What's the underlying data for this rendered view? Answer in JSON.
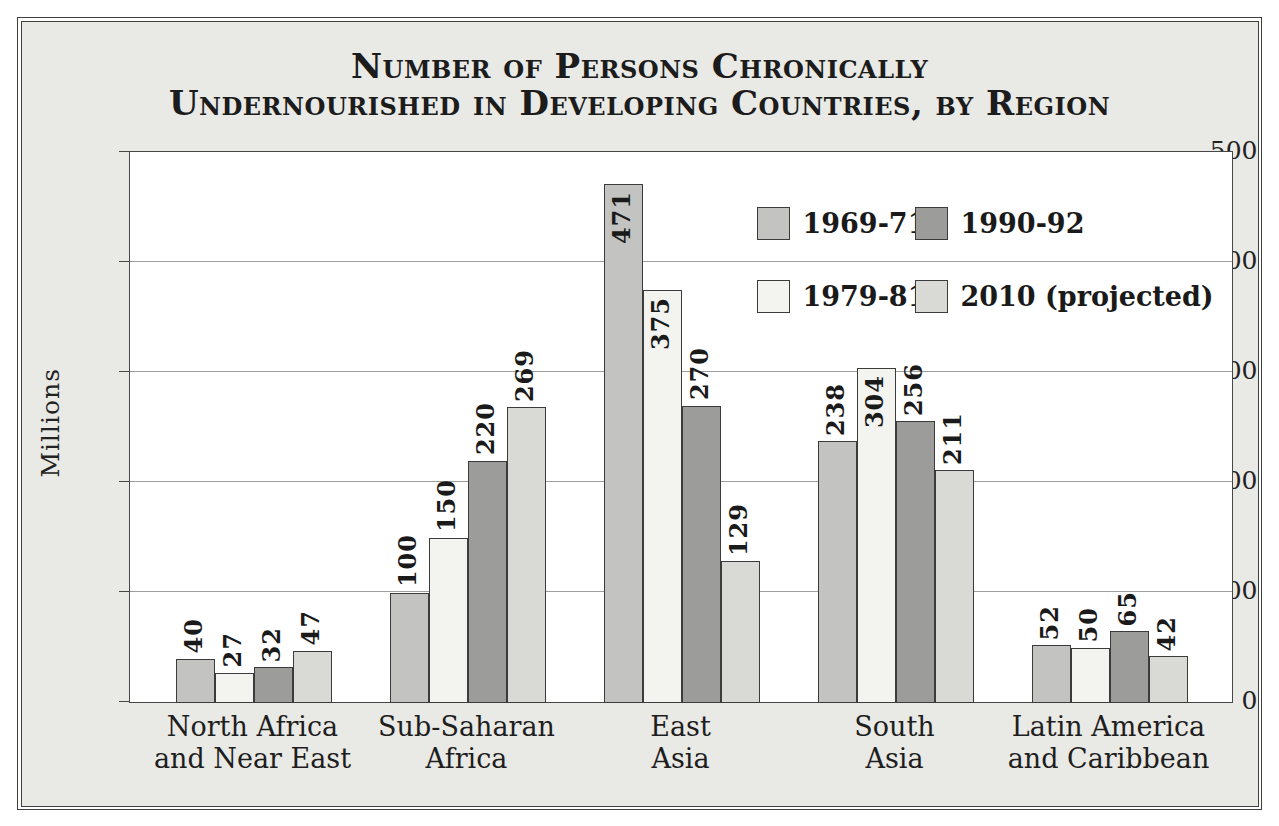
{
  "title": {
    "line1": "Number of Persons Chronically",
    "line2": "Undernourished in Developing Countries, by Region"
  },
  "y_axis": {
    "label": "Millions",
    "ticks": [
      0,
      100,
      200,
      300,
      400,
      500
    ],
    "max": 500
  },
  "legend": [
    {
      "label": "1969-71",
      "color": "#c3c3c1",
      "series_index": 0
    },
    {
      "label": "1990-92",
      "color": "#9c9c9a",
      "series_index": 2
    },
    {
      "label": "1979-81",
      "color": "#f3f3f0",
      "series_index": 1
    },
    {
      "label": "2010 (projected)",
      "color": "#d9d9d6",
      "series_index": 3
    }
  ],
  "chart_data": {
    "type": "bar",
    "categories": [
      {
        "line1": "North Africa",
        "line2": "and Near East"
      },
      {
        "line1": "Sub-Saharan",
        "line2": "Africa"
      },
      {
        "line1": "East",
        "line2": "Asia"
      },
      {
        "line1": "South",
        "line2": "Asia"
      },
      {
        "line1": "Latin America",
        "line2": "and Caribbean"
      }
    ],
    "series": [
      {
        "name": "1969-71",
        "color": "#c3c3c1",
        "values": [
          40,
          100,
          471,
          238,
          52
        ]
      },
      {
        "name": "1979-81",
        "color": "#f3f3f0",
        "values": [
          27,
          150,
          375,
          304,
          50
        ]
      },
      {
        "name": "1990-92",
        "color": "#9c9c9a",
        "values": [
          32,
          220,
          270,
          256,
          65
        ]
      },
      {
        "name": "2010 (projected)",
        "color": "#d9d9d6",
        "values": [
          47,
          269,
          129,
          211,
          42
        ]
      }
    ],
    "ylim": [
      0,
      500
    ],
    "ylabel": "Millions",
    "grid": true,
    "legend_position": "inside upper right",
    "value_label_note": "values printed rotated 90° above each bar; placed inside bar top when value > 300"
  }
}
